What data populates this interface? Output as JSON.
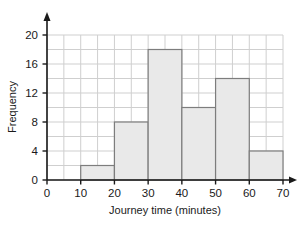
{
  "chart_data": {
    "type": "bar",
    "title": "",
    "xlabel": "Journey time (minutes)",
    "ylabel": "Frequency",
    "categories": [
      "0-10",
      "10-20",
      "20-30",
      "30-40",
      "40-50",
      "50-60",
      "60-70"
    ],
    "bin_edges": [
      0,
      10,
      20,
      30,
      40,
      50,
      60,
      70
    ],
    "values": [
      0,
      2,
      8,
      18,
      10,
      14,
      4
    ],
    "xlim": [
      0,
      70
    ],
    "ylim": [
      0,
      20
    ],
    "x_ticks": [
      "0",
      "10",
      "20",
      "30",
      "40",
      "50",
      "60",
      "70"
    ],
    "x_tick_values": [
      0,
      10,
      20,
      30,
      40,
      50,
      60,
      70
    ],
    "y_ticks": [
      "0",
      "4",
      "8",
      "12",
      "16",
      "20"
    ],
    "y_tick_values": [
      0,
      4,
      8,
      12,
      16,
      20
    ],
    "grid": true,
    "grid_x_step": 5,
    "grid_y_step": 2,
    "legend": "none",
    "bar_fill_color": "#e9e9e9",
    "bar_border_color": "#7d7d7d",
    "grid_color": "#cfcfcf",
    "axis_color": "#1a1a1a",
    "background_color": "#ffffff",
    "axis_arrows": true
  }
}
